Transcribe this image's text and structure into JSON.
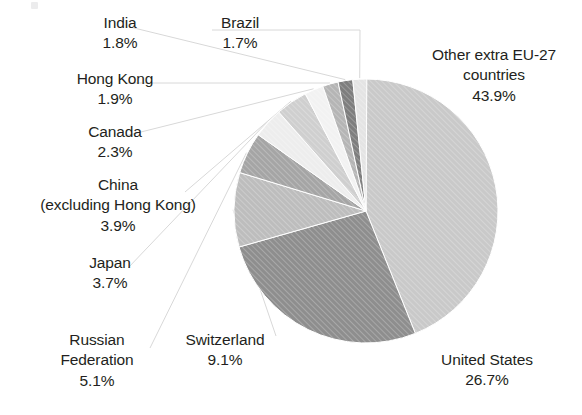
{
  "figure": {
    "background": "#ffffff",
    "text_color": "#231f20",
    "leader_color": "#d8d8d8"
  },
  "chart_data": {
    "type": "pie",
    "title": "",
    "subtitle": "",
    "xlabel": "",
    "ylabel": "",
    "legend": "none",
    "grid": false,
    "units": "percent",
    "start_angle_deg": 0,
    "direction": "clockwise",
    "center": {
      "x": 366,
      "y": 211
    },
    "radius": 132,
    "total": 100.1,
    "categories": [
      "Other extra EU-27 countries",
      "United States",
      "Switzerland",
      "Russian Federation",
      "Japan",
      "China (excluding Hong Kong)",
      "Canada",
      "Hong Kong",
      "India",
      "Brazil"
    ],
    "values": [
      43.9,
      26.7,
      9.1,
      5.1,
      3.7,
      3.9,
      2.3,
      1.9,
      1.8,
      1.7
    ],
    "colors": [
      "#c9c9c9",
      "#8e8e8e",
      "#bdbdbd",
      "#a5a5a5",
      "#ededed",
      "#cfcfcf",
      "#f2f2f2",
      "#b5b5b5",
      "#7e7e7e",
      "#e4e4e4"
    ],
    "slices": [
      {
        "name": "Other extra EU-27 countries",
        "value": 43.9,
        "label": "43.9%",
        "color": "#c9c9c9",
        "start_deg": 0,
        "end_deg": 158.04
      },
      {
        "name": "United States",
        "value": 26.7,
        "label": "26.7%",
        "color": "#8e8e8e",
        "start_deg": 158.04,
        "end_deg": 254.16
      },
      {
        "name": "Switzerland",
        "value": 9.1,
        "label": "9.1%",
        "color": "#bdbdbd",
        "start_deg": 254.16,
        "end_deg": 286.92
      },
      {
        "name": "Russian Federation",
        "value": 5.1,
        "label": "5.1%",
        "color": "#a5a5a5",
        "start_deg": 286.92,
        "end_deg": 305.28
      },
      {
        "name": "Japan",
        "value": 3.7,
        "label": "3.7%",
        "color": "#ededed",
        "start_deg": 305.28,
        "end_deg": 318.6
      },
      {
        "name": "China (excluding Hong Kong)",
        "value": 3.9,
        "label": "3.9%",
        "color": "#cfcfcf",
        "start_deg": 318.6,
        "end_deg": 332.64
      },
      {
        "name": "Canada",
        "value": 2.3,
        "label": "2.3%",
        "color": "#f2f2f2",
        "start_deg": 332.64,
        "end_deg": 340.92
      },
      {
        "name": "Hong Kong",
        "value": 1.9,
        "label": "1.9%",
        "color": "#b5b5b5",
        "start_deg": 340.92,
        "end_deg": 347.76
      },
      {
        "name": "India",
        "value": 1.8,
        "label": "1.8%",
        "color": "#7e7e7e",
        "start_deg": 347.76,
        "end_deg": 354.24
      },
      {
        "name": "Brazil",
        "value": 1.7,
        "label": "1.7%",
        "color": "#e4e4e4",
        "start_deg": 354.24,
        "end_deg": 360.36
      }
    ]
  },
  "labels": {
    "india": {
      "name": "India",
      "value": "1.8%"
    },
    "brazil": {
      "name": "Brazil",
      "value": "1.7%"
    },
    "hong_kong": {
      "name": "Hong Kong",
      "value": "1.9%"
    },
    "canada": {
      "name": "Canada",
      "value": "2.3%"
    },
    "china_l1": {
      "name": "China",
      "name2": "(excluding Hong Kong)",
      "value": "3.9%"
    },
    "japan": {
      "name": "Japan",
      "value": "3.7%"
    },
    "russia": {
      "name": "Russian",
      "name2": "Federation",
      "value": "5.1%"
    },
    "switzerland": {
      "name": "Switzerland",
      "value": "9.1%"
    },
    "other_eu": {
      "name": "Other extra EU-27",
      "name2": "countries",
      "value": "43.9%"
    },
    "usa": {
      "name": "United States",
      "value": "26.7%"
    }
  }
}
